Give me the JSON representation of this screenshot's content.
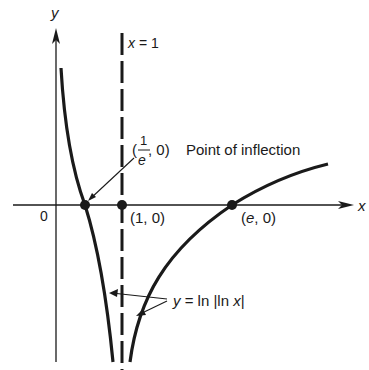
{
  "figure": {
    "axes": {
      "x_label": "x",
      "y_label": "y",
      "origin_label": "0"
    },
    "asymptote": {
      "label": "x = 1",
      "x": 1
    },
    "points": [
      {
        "id": "inflection",
        "label_prefix": "(",
        "label_num": "1",
        "label_den": "e",
        "label_suffix": ", 0)",
        "description": "Point of inflection"
      },
      {
        "id": "one",
        "label": "(1, 0)"
      },
      {
        "id": "e",
        "label": "(e, 0)"
      }
    ],
    "curve_label": "y = ln |ln x|",
    "colors": {
      "ink": "#1a1a1a",
      "background": "#ffffff"
    }
  }
}
